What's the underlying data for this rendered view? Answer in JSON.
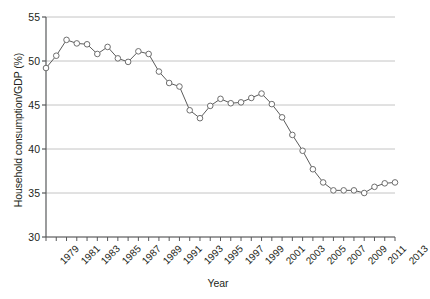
{
  "chart_data": {
    "type": "line",
    "title": "",
    "xlabel": "Year",
    "ylabel": "Household consumption/GDP (%)",
    "xlim": [
      1979,
      2013
    ],
    "ylim": [
      30,
      55
    ],
    "yticks": [
      30,
      35,
      40,
      45,
      50,
      55
    ],
    "ytick_labels": [
      "30",
      "35",
      "40",
      "45",
      "50",
      "55"
    ],
    "xticks": [
      1979,
      1981,
      1983,
      1985,
      1987,
      1989,
      1991,
      1993,
      1995,
      1997,
      1999,
      2001,
      2003,
      2005,
      2007,
      2009,
      2011,
      2013
    ],
    "xtick_labels": [
      "1979",
      "1981",
      "1983",
      "1985",
      "1987",
      "1989",
      "1991",
      "1993",
      "1995",
      "1997",
      "1999",
      "2001",
      "2003",
      "2005",
      "2007",
      "2009",
      "2011",
      "2013"
    ],
    "grid": "horizontal",
    "legend": "none",
    "marker": "open-circle",
    "line_color": "#5b5b5b",
    "marker_color": "#6e6e6e",
    "grid_color": "#b5b5b5",
    "axis_color": "#58595b",
    "x": [
      1979,
      1980,
      1981,
      1982,
      1983,
      1984,
      1985,
      1986,
      1987,
      1988,
      1989,
      1990,
      1991,
      1992,
      1993,
      1994,
      1995,
      1996,
      1997,
      1998,
      1999,
      2000,
      2001,
      2002,
      2003,
      2004,
      2005,
      2006,
      2007,
      2008,
      2009,
      2010,
      2011,
      2012,
      2013
    ],
    "values": [
      49.2,
      50.6,
      52.4,
      52.0,
      51.9,
      50.8,
      51.6,
      50.3,
      49.9,
      51.1,
      50.8,
      48.8,
      47.5,
      47.1,
      44.4,
      43.5,
      44.9,
      45.7,
      45.2,
      45.3,
      45.8,
      46.3,
      45.1,
      43.6,
      41.6,
      39.8,
      37.7,
      36.2,
      35.3,
      35.3,
      35.3,
      35.0,
      35.7,
      36.1,
      36.2
    ],
    "series_name": "Household consumption/GDP"
  }
}
